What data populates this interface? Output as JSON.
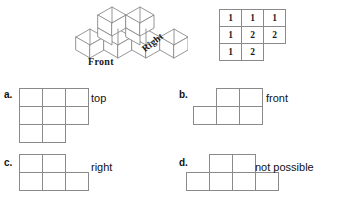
{
  "figure": {
    "front_label": "Front",
    "right_label": "Right"
  },
  "number_grid": {
    "rows": [
      [
        "1",
        "1",
        "1"
      ],
      [
        "1",
        "2",
        "2"
      ],
      [
        "1",
        "2",
        ""
      ]
    ]
  },
  "options": [
    {
      "letter": "a.",
      "text": "top",
      "shape": "3x3-grid-missing-bottom-right",
      "cells": [
        {
          "col": 0,
          "row": 0
        },
        {
          "col": 1,
          "row": 0
        },
        {
          "col": 2,
          "row": 0
        },
        {
          "col": 0,
          "row": 1
        },
        {
          "col": 1,
          "row": 1
        },
        {
          "col": 2,
          "row": 1
        },
        {
          "col": 0,
          "row": 2
        },
        {
          "col": 1,
          "row": 2
        }
      ]
    },
    {
      "letter": "b.",
      "text": "front",
      "shape": "two-over-three-right-aligned-top",
      "cells": [
        {
          "col": 1,
          "row": 0
        },
        {
          "col": 2,
          "row": 0
        },
        {
          "col": 0,
          "row": 1
        },
        {
          "col": 1,
          "row": 1
        },
        {
          "col": 2,
          "row": 1
        }
      ]
    },
    {
      "letter": "c.",
      "text": "right",
      "shape": "two-over-three-left-aligned-top",
      "cells": [
        {
          "col": 0,
          "row": 0
        },
        {
          "col": 1,
          "row": 0
        },
        {
          "col": 0,
          "row": 1
        },
        {
          "col": 1,
          "row": 1
        },
        {
          "col": 2,
          "row": 1
        }
      ]
    },
    {
      "letter": "d.",
      "text": "not possible",
      "shape": "two-over-four-centered-top",
      "cells": [
        {
          "col": 1,
          "row": 0
        },
        {
          "col": 2,
          "row": 0
        },
        {
          "col": 0,
          "row": 1
        },
        {
          "col": 1,
          "row": 1
        },
        {
          "col": 2,
          "row": 1
        },
        {
          "col": 3,
          "row": 1
        }
      ]
    }
  ],
  "colors": {
    "line": "#8a8a8a",
    "text": "#111111",
    "background": "#ffffff"
  }
}
